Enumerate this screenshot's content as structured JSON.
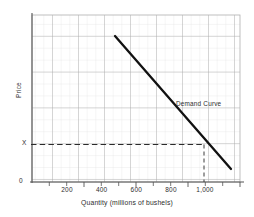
{
  "chart_data": {
    "type": "line",
    "title": "",
    "xlabel": "Quantity (millions of bushels)",
    "ylabel": "Price",
    "xlim": [
      0,
      1200
    ],
    "ylim": [
      0,
      14
    ],
    "grid": true,
    "grid_columns": 24,
    "grid_rows": 14,
    "legend_position": "inline-annotation",
    "x_tick_labels": [
      "200",
      "400",
      "600",
      "800",
      "1,000"
    ],
    "x_tick_values": [
      200,
      400,
      600,
      800,
      1000
    ],
    "y_tick_labels": [
      "0",
      "X"
    ],
    "y_tick_values": [
      0,
      3
    ],
    "series": [
      {
        "name": "Demand Curve",
        "annotation": "Demand Curve",
        "x": [
          500,
          1150
        ],
        "y": [
          12.3,
          1.2
        ],
        "color": "#111111",
        "linewidth": 2.2
      }
    ],
    "reference_lines": [
      {
        "name": "price-guideline",
        "orientation": "horizontal",
        "value": 3,
        "label": "X",
        "style": "dashed",
        "from_x": 0,
        "to_x": 1000
      },
      {
        "name": "quantity-guideline",
        "orientation": "vertical",
        "value": 1000,
        "label": "1,000",
        "style": "dashed",
        "from_y": 0,
        "to_y": 3
      }
    ],
    "intersection_point": {
      "x": 1000,
      "y": 3
    },
    "colors": {
      "grid_minor": "#d8d8d8",
      "grid_major": "#9a9a9a",
      "axis": "#4a4a4a",
      "curve": "#111111",
      "dashed": "#333333",
      "text": "#2e2e2e",
      "background": "#ffffff"
    }
  },
  "labels": {
    "x_axis_title": "Quantity (millions of bushels)",
    "y_axis_title": "Price",
    "origin": "0",
    "price_marker": "X",
    "curve_annotation": "Demand Curve",
    "tick_200": "200",
    "tick_400": "400",
    "tick_600": "600",
    "tick_800": "800",
    "tick_1000": "1,000"
  }
}
